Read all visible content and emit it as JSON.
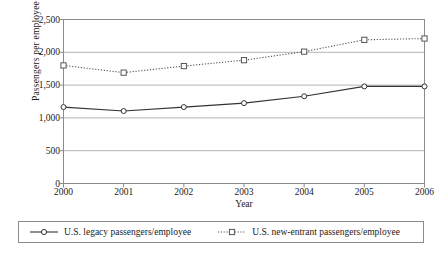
{
  "chart_data": {
    "type": "line",
    "title": "",
    "xlabel": "Year",
    "ylabel": "Passengers per employee",
    "categories": [
      "2000",
      "2001",
      "2002",
      "2003",
      "2004",
      "2005",
      "2006"
    ],
    "x": [
      2000,
      2001,
      2002,
      2003,
      2004,
      2005,
      2006
    ],
    "xlim": [
      2000,
      2006
    ],
    "ylim": [
      0,
      2500
    ],
    "yticks": [
      "2,500",
      "2,000",
      "1,500",
      "1,000",
      "500",
      "0"
    ],
    "ytick_values": [
      2500,
      2000,
      1500,
      1000,
      500,
      0
    ],
    "grid": "horizontal",
    "legend_position": "bottom",
    "series": [
      {
        "name": "U.S. legacy passengers/employee",
        "values": [
          1165,
          1105,
          1165,
          1225,
          1330,
          1480,
          1480
        ],
        "line_style": "solid",
        "marker": "circle",
        "color": "#333333"
      },
      {
        "name": "U.S. new-entrant passengers/employee",
        "values": [
          1800,
          1690,
          1790,
          1880,
          2010,
          2190,
          2210
        ],
        "line_style": "dotted",
        "marker": "square",
        "color": "#555555"
      }
    ]
  },
  "legend": {
    "entries": [
      {
        "label": "U.S. legacy passengers/employee"
      },
      {
        "label": "U.S. new-entrant passengers/employee"
      }
    ]
  },
  "axes": {
    "x_title": "Year",
    "y_title": "Passengers per employee"
  },
  "colors": {
    "frame": "#8a8a8a",
    "grid": "#b4b4b4",
    "series_legacy": "#333333",
    "series_new_entrant": "#555555",
    "text": "#1a1a1a"
  }
}
